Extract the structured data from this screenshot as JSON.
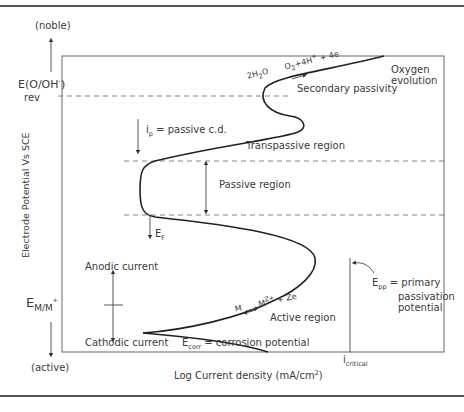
{
  "figure": {
    "y_axis": {
      "label": "Electrode Potential Vs  SCE",
      "top_label": "(noble)",
      "bottom_label": "(active)",
      "marks": [
        {
          "id": "e_o_oh_rev",
          "main": "E(O/OH",
          "sup": "-",
          "close": ")",
          "sub": "rev"
        },
        {
          "id": "e_m_m",
          "main": "E",
          "sub": "M/M",
          "sup": "+"
        }
      ]
    },
    "x_axis": {
      "label": "Log Current density (mA/cm",
      "label_sup": "2",
      "label_close": ")",
      "marks": [
        {
          "id": "i_critical",
          "main": "i",
          "sub": "critical"
        }
      ]
    },
    "regions": {
      "oxygen_evolution": [
        "Oxygen",
        "evolution"
      ],
      "secondary_passivity": "Secondary passivity",
      "transpassive": "Transpassive region",
      "passive": "Passive region",
      "active": "Active region"
    },
    "annotations": {
      "oxygen_reaction": {
        "lhs": "2H",
        "lhs_sub": "2",
        "lhs_tail": "O",
        "rhs": "O",
        "rhs_sub": "2",
        "rhs_tail": "+4H",
        "rhs_sup": "+",
        "rhs_end": " + 4e"
      },
      "metal_reaction": {
        "lhs": "M",
        "rhs": "M",
        "rhs_sup": "Z+",
        "rhs_end": " + Ze"
      },
      "passive_cd": {
        "main": "i",
        "sub": "p",
        "rest": " = passive c.d."
      },
      "flade": {
        "main": "E",
        "sub": "F"
      },
      "epp": {
        "main": "E",
        "sub": "pp",
        "rest": " = primary",
        "line2": "passivation",
        "line3": "potential"
      },
      "ecorr": {
        "main": "E",
        "sub": "corr",
        "rest": " = corrosion potential"
      },
      "anodic": "Anodic current",
      "cathodic": "Cathodic current"
    },
    "colors": {
      "curve": "#222222",
      "frame": "#666666",
      "dash": "#777777",
      "text": "#3a3a3a"
    }
  }
}
